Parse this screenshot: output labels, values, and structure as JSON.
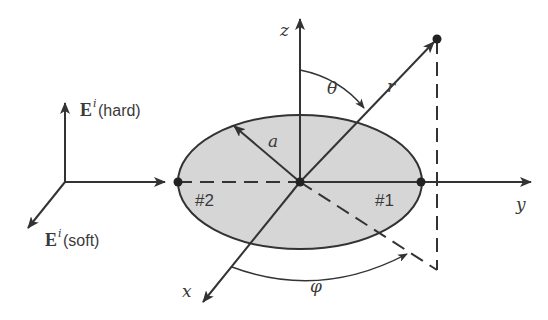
{
  "figure": {
    "colors": {
      "ink": "#333333",
      "ellipse_fill": "#d6d6d6",
      "background": "#ffffff"
    },
    "axes": {
      "z_label": "z",
      "y_label": "y",
      "x_label": "x"
    },
    "angles": {
      "theta_label": "θ",
      "phi_label": "φ"
    },
    "radius": {
      "r_label": "r",
      "a_label": "a"
    },
    "points": {
      "p1_label": "#1",
      "p2_label": "#2"
    },
    "incident_field": {
      "hard": {
        "symbol": "E",
        "superscript": "i",
        "polarization": "(hard)"
      },
      "soft": {
        "symbol": "E",
        "superscript": "i",
        "polarization": "(soft)"
      }
    }
  }
}
